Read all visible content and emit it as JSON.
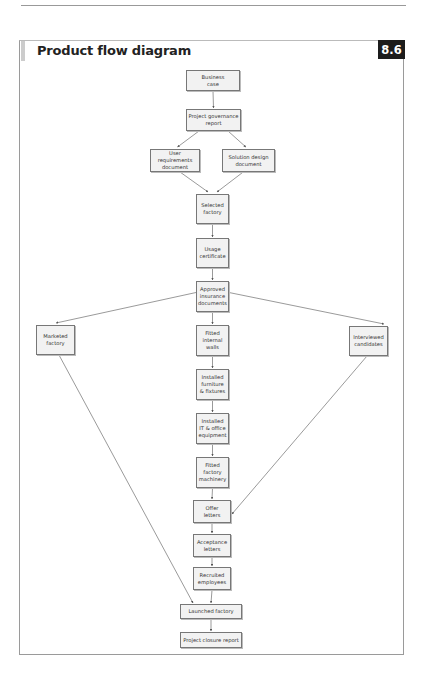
{
  "header": {
    "title": "Product flow diagram",
    "badge": "8.6"
  },
  "nodes": [
    {
      "id": "business-case",
      "label": "Business\ncase"
    },
    {
      "id": "project-governance-report",
      "label": "Project governance\nreport"
    },
    {
      "id": "user-requirements-document",
      "label": "User requirements\ndocument"
    },
    {
      "id": "solution-design-document",
      "label": "Solution design\ndocument"
    },
    {
      "id": "selected-factory",
      "label": "Selected\nfactory"
    },
    {
      "id": "usage-certificate",
      "label": "Usage\ncertificate"
    },
    {
      "id": "approved-insurance-documents",
      "label": "Approved\ninsurance\ndocuments"
    },
    {
      "id": "marketed-factory",
      "label": "Marketed\nfactory"
    },
    {
      "id": "fitted-internal-walls",
      "label": "Fitted\ninternal\nwalls"
    },
    {
      "id": "interviewed-candidates",
      "label": "Interviewed\ncandidates"
    },
    {
      "id": "installed-furniture-fixtures",
      "label": "Installed\nfurniture\n& fixtures"
    },
    {
      "id": "installed-it-office-equipment",
      "label": "Installed\nIT & office\nequipment"
    },
    {
      "id": "fitted-factory-machinery",
      "label": "Fitted\nfactory\nmachinery"
    },
    {
      "id": "offer-letters",
      "label": "Offer\nletters"
    },
    {
      "id": "acceptance-letters",
      "label": "Acceptance\nletters"
    },
    {
      "id": "recruited-employees",
      "label": "Recruited\nemployees"
    },
    {
      "id": "launched-factory",
      "label": "Launched factory"
    },
    {
      "id": "project-closure-report",
      "label": "Project closure report"
    }
  ],
  "edges": [
    [
      "business-case",
      "project-governance-report"
    ],
    [
      "project-governance-report",
      "user-requirements-document"
    ],
    [
      "project-governance-report",
      "solution-design-document"
    ],
    [
      "user-requirements-document",
      "selected-factory"
    ],
    [
      "solution-design-document",
      "selected-factory"
    ],
    [
      "selected-factory",
      "usage-certificate"
    ],
    [
      "usage-certificate",
      "approved-insurance-documents"
    ],
    [
      "approved-insurance-documents",
      "marketed-factory"
    ],
    [
      "approved-insurance-documents",
      "fitted-internal-walls"
    ],
    [
      "approved-insurance-documents",
      "interviewed-candidates"
    ],
    [
      "fitted-internal-walls",
      "installed-furniture-fixtures"
    ],
    [
      "installed-furniture-fixtures",
      "installed-it-office-equipment"
    ],
    [
      "installed-it-office-equipment",
      "fitted-factory-machinery"
    ],
    [
      "fitted-factory-machinery",
      "offer-letters"
    ],
    [
      "interviewed-candidates",
      "offer-letters"
    ],
    [
      "offer-letters",
      "acceptance-letters"
    ],
    [
      "acceptance-letters",
      "recruited-employees"
    ],
    [
      "marketed-factory",
      "launched-factory"
    ],
    [
      "recruited-employees",
      "launched-factory"
    ],
    [
      "launched-factory",
      "project-closure-report"
    ]
  ],
  "colors": {
    "node_fill": "#f2f2f2",
    "node_border": "#777777",
    "edge": "#555555",
    "badge_bg": "#1c1c1c",
    "badge_text": "#ffffff"
  }
}
